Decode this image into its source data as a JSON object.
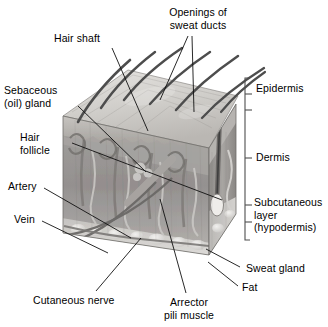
{
  "figure": {
    "type": "anatomical-illustration",
    "style": "grayscale 3D block diagram",
    "palette": {
      "background": "#ffffff",
      "text": "#000000",
      "leader_line": "#1a1a1a",
      "bracket": "#555555",
      "epidermis_surface": "#d8d6d3",
      "epidermis_band": "#b9b6b2",
      "dermis": "#9d9a97",
      "dermis_shadow": "#7e7c79",
      "subcutaneous": "#cfcdca",
      "fat_lobule": "#eceae7",
      "hair": "#4a4a4a",
      "vessel": "#6e6c6a",
      "follicle": "#8d8a87"
    }
  },
  "labels": {
    "hair_shaft": "Hair shaft",
    "openings_sweat_ducts": "Openings of\nsweat ducts",
    "sebaceous_gland": "Sebaceous\n(oil) gland",
    "hair_follicle": "Hair\nfollicle",
    "artery": "Artery",
    "vein": "Vein",
    "cutaneous_nerve": "Cutaneous nerve",
    "arrector_pili": "Arrector\npili muscle",
    "sweat_gland": "Sweat gland",
    "fat": "Fat",
    "epidermis": "Epidermis",
    "dermis": "Dermis",
    "subcutaneous_layer": "Subcutaneous\nlayer\n(hypodermis)"
  },
  "layers": [
    {
      "name": "Epidermis",
      "bracket_top": 78,
      "bracket_bottom": 110
    },
    {
      "name": "Dermis",
      "bracket_top": 110,
      "bracket_bottom": 205
    },
    {
      "name": "Subcutaneous layer (hypodermis)",
      "bracket_top": 205,
      "bracket_bottom": 240
    }
  ],
  "structures": [
    "hair shaft",
    "hair follicle",
    "sebaceous (oil) gland",
    "arrector pili muscle",
    "sweat gland",
    "openings of sweat ducts",
    "artery",
    "vein",
    "cutaneous nerve",
    "fat"
  ]
}
